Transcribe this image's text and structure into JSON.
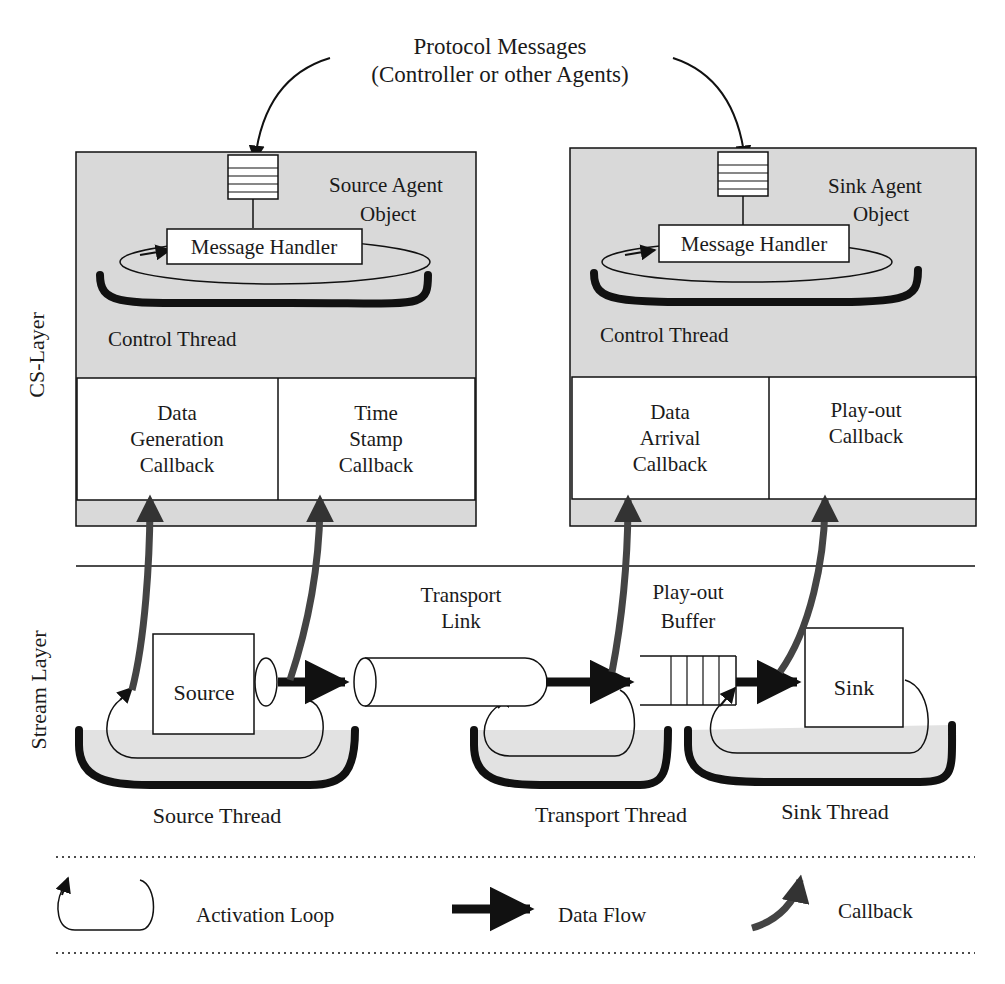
{
  "header": {
    "line1": "Protocol Messages",
    "line2": "(Controller or other Agents)"
  },
  "layers": {
    "cs_layer": "CS-Layer",
    "stream_layer": "Stream Layer"
  },
  "source_agent": {
    "title_line1": "Source Agent",
    "title_line2": "Object",
    "message_handler": "Message Handler",
    "control_thread": "Control Thread",
    "callbacks": [
      {
        "lines": [
          "Data",
          "Generation",
          "Callback"
        ]
      },
      {
        "lines": [
          "Time",
          "Stamp",
          "Callback"
        ]
      }
    ]
  },
  "sink_agent": {
    "title_line1": "Sink Agent",
    "title_line2": "Object",
    "message_handler": "Message Handler",
    "control_thread": "Control Thread",
    "callbacks": [
      {
        "lines": [
          "Data",
          "Arrival",
          "Callback"
        ]
      },
      {
        "lines": [
          "Play-out",
          "Callback"
        ]
      }
    ]
  },
  "stream": {
    "source": "Source",
    "sink": "Sink",
    "transport_link": [
      "Transport",
      "Link"
    ],
    "playout_buffer": [
      "Play-out",
      "Buffer"
    ],
    "source_thread": "Source Thread",
    "transport_thread": "Transport Thread",
    "sink_thread": "Sink Thread"
  },
  "legend": {
    "activation_loop": "Activation Loop",
    "data_flow": "Data Flow",
    "callback": "Callback"
  },
  "colors": {
    "agent_fill": "#d9d9d9",
    "thread_fill": "#e2e2e2",
    "callback_arrow": "#444444",
    "stroke": "#1a1a1a"
  }
}
